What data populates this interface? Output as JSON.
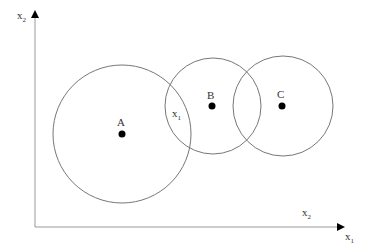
{
  "axes": {
    "y_label": "x",
    "y_label_sub": "2",
    "x_label": "x",
    "x_label_sub": "1",
    "x_axis_caption": "x",
    "x_axis_caption_sub": "2"
  },
  "circles": [
    {
      "id": "A",
      "label": "A",
      "cx": 122,
      "cy": 134,
      "r": 69
    },
    {
      "id": "B",
      "label": "B",
      "cx": 213,
      "cy": 106,
      "r": 48
    },
    {
      "id": "C",
      "label": "C",
      "cx": 283,
      "cy": 106,
      "r": 50
    }
  ],
  "overlap_label": {
    "text": "x",
    "sub": "1"
  },
  "colors": {
    "line": "#777777",
    "point": "#000000",
    "axis": "#999999"
  }
}
